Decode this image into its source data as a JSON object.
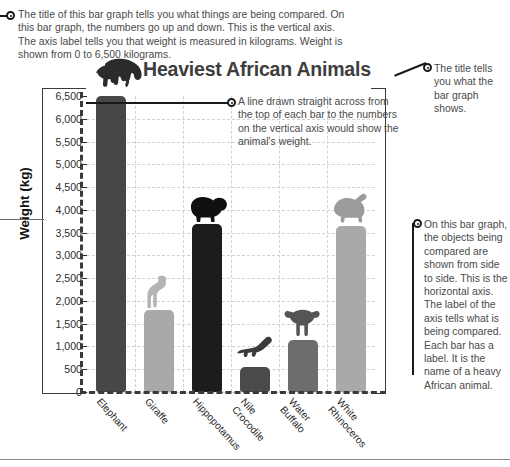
{
  "chart_data": {
    "type": "bar",
    "title": "Heaviest African Animals",
    "xlabel": "",
    "ylabel": "Weight (kg)",
    "ylim": [
      0,
      6500
    ],
    "ytick_step": 500,
    "grid": true,
    "legend": "none",
    "categories": [
      "Elephant",
      "Giraffe",
      "Hippopotamus",
      "Nile Crocodile",
      "Water Buffalo",
      "White Rhinoceros"
    ],
    "values": [
      6500,
      1800,
      3700,
      550,
      1150,
      3650
    ],
    "ytick_labels": [
      "6,500",
      "6,000",
      "5,500",
      "5,000",
      "4,500",
      "4,000",
      "3,500",
      "3,000",
      "2,500",
      "2,000",
      "1,500",
      "1,000",
      "500",
      "0"
    ],
    "bar_colors": [
      "#474747",
      "#a9a9a9",
      "#1c1c1c",
      "#4a4a4a",
      "#6d6d6d",
      "#a9a9a9"
    ],
    "icon_colors": [
      "#2b2b2b",
      "#b4b4b4",
      "#101010",
      "#3a3a3a",
      "#555555",
      "#9b9b9b"
    ],
    "icon_names": [
      "elephant-silhouette",
      "giraffe-silhouette",
      "hippopotamus-silhouette",
      "nile-crocodile-silhouette",
      "water-buffalo-silhouette",
      "white-rhinoceros-silhouette"
    ],
    "category_labels_2line": [
      [
        "Elephant",
        ""
      ],
      [
        "Giraffe",
        ""
      ],
      [
        "Hippopotamus",
        ""
      ],
      [
        "Nile",
        "Crocodile"
      ],
      [
        "Water",
        "Buffalo"
      ],
      [
        "White",
        "Rhinoceros"
      ]
    ]
  },
  "annotations": {
    "top": "The title of this bar graph tells you what things are being compared. On this bar graph, the numbers go up and down. This is the vertical axis. The axis label tells you that weight is measured in kilograms. Weight is shown from 0 to 6,500 kilograms.",
    "title_note": "The title tells you what the bar graph shows.",
    "line_note": "A line drawn straight across from the top of each bar to the numbers on the vertical axis would show the animal's weight.",
    "horizontal_axis_note": "On this bar graph, the objects being compared are shown from side to side. This is the horizontal axis. The label of the axis tells what is being compared. Each bar has a label. It is the name of a heavy African animal."
  },
  "colors": {
    "note_text": "#4a4a4a",
    "axis": "#3a3a3a",
    "grid": "#d2d2d2",
    "title": "#3d3d3d"
  }
}
